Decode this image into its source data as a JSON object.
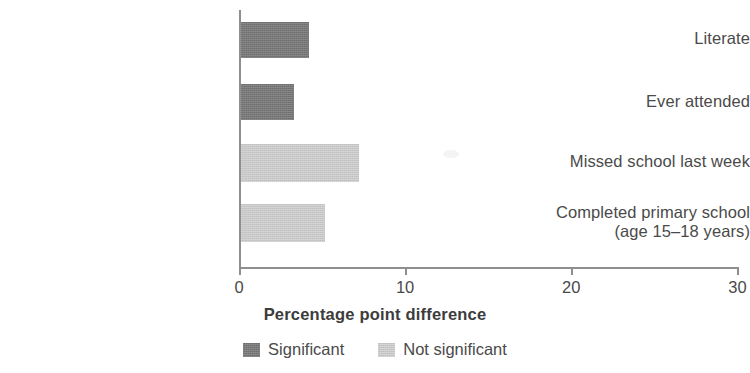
{
  "chart_data": {
    "type": "bar",
    "orientation": "horizontal",
    "title": "",
    "xlabel": "Percentage point difference",
    "ylabel": "",
    "xlim": [
      0,
      30
    ],
    "xticks": [
      0,
      10,
      20,
      30
    ],
    "xtick_labels": [
      "0",
      "10",
      "20",
      "30"
    ],
    "grid": false,
    "legend_position": "bottom",
    "categories": [
      "Literate",
      "Ever attended",
      "Missed school last week",
      "Completed primary school\n(age 15–18 years)"
    ],
    "values": [
      4.1,
      3.2,
      7.1,
      5.1
    ],
    "point_significance": [
      "Significant",
      "Significant",
      "Not significant",
      "Not significant"
    ],
    "series": [
      {
        "name": "Significant",
        "color": "#767676",
        "points": [
          {
            "category": "Literate",
            "value": 4.1
          },
          {
            "category": "Ever attended",
            "value": 3.2
          }
        ]
      },
      {
        "name": "Not significant",
        "color": "#cfcfcf",
        "points": [
          {
            "category": "Missed school last week",
            "value": 7.1
          },
          {
            "category": "Completed primary school (age 15–18 years)",
            "value": 5.1
          }
        ]
      }
    ],
    "legend": [
      {
        "label": "Significant",
        "color": "#767676"
      },
      {
        "label": "Not significant",
        "color": "#cfcfcf"
      }
    ]
  },
  "categories": [
    {
      "label": "Literate",
      "value": 4.1,
      "significance": "sig"
    },
    {
      "label": "Ever attended",
      "value": 3.2,
      "significance": "sig"
    },
    {
      "label": "Missed school last week",
      "value": 7.1,
      "significance": "notsig"
    },
    {
      "label": "Completed primary school\n(age 15–18 years)",
      "value": 5.1,
      "significance": "notsig"
    }
  ],
  "axis": {
    "title": "Percentage point difference",
    "ticks": [
      "0",
      "10",
      "20",
      "30"
    ]
  },
  "legend": {
    "significant_label": "Significant",
    "not_significant_label": "Not significant"
  },
  "colors": {
    "significant": "#767676",
    "not_significant": "#cfcfcf",
    "axis": "#8e8e8e",
    "text": "#4a4a4a"
  }
}
